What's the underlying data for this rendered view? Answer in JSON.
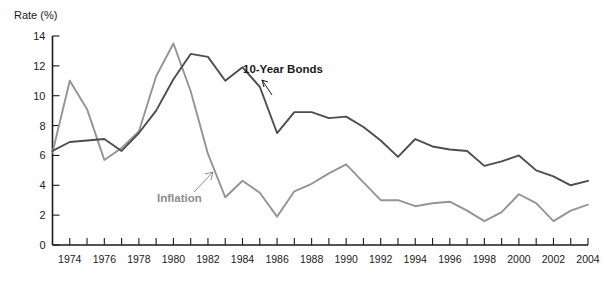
{
  "chart_data": {
    "type": "line",
    "title": "",
    "ylabel": "Rate (%)",
    "xlabel": "",
    "ylim": [
      0,
      14
    ],
    "ytick_values": [
      0,
      2,
      4,
      6,
      8,
      10,
      12,
      14
    ],
    "ytick_labels": [
      "0",
      "2",
      "4",
      "6",
      "8",
      "10",
      "12",
      "14"
    ],
    "xlim": [
      1973,
      2004
    ],
    "x": [
      1973,
      1974,
      1975,
      1976,
      1977,
      1978,
      1979,
      1980,
      1981,
      1982,
      1983,
      1984,
      1985,
      1986,
      1987,
      1988,
      1989,
      1990,
      1991,
      1992,
      1993,
      1994,
      1995,
      1996,
      1997,
      1998,
      1999,
      2000,
      2001,
      2002,
      2003,
      2004
    ],
    "xtick_labels": [
      "1974",
      "1976",
      "1978",
      "1980",
      "1982",
      "1984",
      "1986",
      "1988",
      "1990",
      "1992",
      "1994",
      "1996",
      "1998",
      "2000",
      "2002",
      "2004"
    ],
    "xtick_values": [
      1974,
      1976,
      1978,
      1980,
      1982,
      1984,
      1986,
      1988,
      1990,
      1992,
      1994,
      1996,
      1998,
      2000,
      2002,
      2004
    ],
    "grid": false,
    "legend_position": "inline-annotations",
    "series": [
      {
        "name": "10-Year Bonds",
        "color": "#4d4d4d",
        "values": [
          6.3,
          6.9,
          7.0,
          7.1,
          6.3,
          7.5,
          9.0,
          11.1,
          12.8,
          12.6,
          11.0,
          11.9,
          10.6,
          7.5,
          8.9,
          8.9,
          8.5,
          8.6,
          7.9,
          7.0,
          5.9,
          7.1,
          6.6,
          6.4,
          6.3,
          5.3,
          5.6,
          6.0,
          5.0,
          4.6,
          4.0,
          4.3
        ]
      },
      {
        "name": "Inflation",
        "color": "#949494",
        "values": [
          6.2,
          11.0,
          9.1,
          5.7,
          6.5,
          7.6,
          11.3,
          13.5,
          10.3,
          6.1,
          3.2,
          4.3,
          3.5,
          1.9,
          3.6,
          4.1,
          4.8,
          5.4,
          4.2,
          3.0,
          3.0,
          2.6,
          2.8,
          2.9,
          2.3,
          1.6,
          2.2,
          3.4,
          2.8,
          1.6,
          2.3,
          2.7
        ]
      }
    ],
    "annotations": [
      {
        "text": "10-Year Bonds",
        "series": "10-Year Bonds"
      },
      {
        "text": "Inflation",
        "series": "Inflation"
      }
    ]
  }
}
